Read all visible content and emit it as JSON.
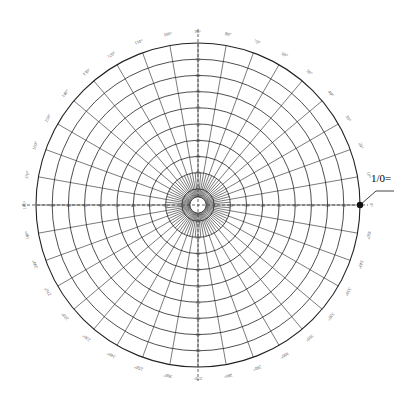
{
  "chart_data": {
    "type": "polar-grid",
    "title": "",
    "center": [
      198,
      205
    ],
    "outer_radius": 162,
    "ring_count": 10,
    "ring_labels": [
      "10",
      "20",
      "30",
      "40",
      "50",
      "60",
      "70",
      "80",
      "90"
    ],
    "spoke_step_deg": 10,
    "inner_spoke_step_deg": 5,
    "angle_labels": [
      "0",
      "10",
      "20",
      "30",
      "40",
      "50",
      "60",
      "70",
      "80",
      "90",
      "100",
      "110",
      "120",
      "130",
      "140",
      "150",
      "160",
      "170",
      "180",
      "190",
      "200",
      "210",
      "220",
      "230",
      "240",
      "250",
      "260",
      "270",
      "280",
      "290",
      "300",
      "310",
      "320",
      "330",
      "340",
      "350"
    ],
    "marker": {
      "angle_deg": 0,
      "label": "1/0="
    },
    "colors": {
      "grid": "#222222",
      "labels": "#555555",
      "background": "#ffffff"
    }
  },
  "annotation": {
    "text": "1/0="
  }
}
